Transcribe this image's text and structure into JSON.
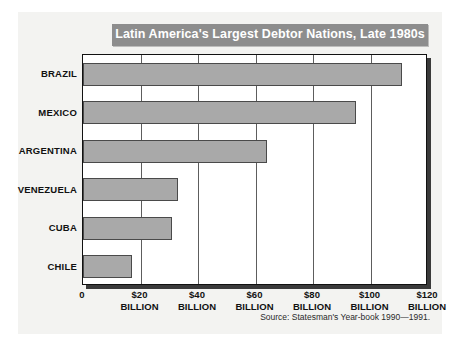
{
  "card": {
    "title": "Latin America's Largest Debtor Nations, Late 1980s",
    "source": "Source: Statesman's Year-book 1990—1991."
  },
  "axis": {
    "origin_label": "0",
    "unit_label": "BILLION",
    "ticks": [
      "0",
      "$20",
      "$40",
      "$60",
      "$80",
      "$100",
      "$120"
    ]
  },
  "colors": {
    "bar_fill": "#a9a9a9",
    "bar_border": "#4a4a4a",
    "banner": "#8d8d8d",
    "banner_text": "#ffffff",
    "card_background": "#f3f3f1",
    "plot_background": "#ffffff",
    "gridline": "#5d5d5d"
  },
  "chart_data": {
    "type": "bar",
    "orientation": "horizontal",
    "title": "Latin America's Largest Debtor Nations, Late 1980s",
    "xlabel": "",
    "ylabel": "",
    "categories": [
      "BRAZIL",
      "MEXICO",
      "ARGENTINA",
      "VENEZUELA",
      "CUBA",
      "CHILE"
    ],
    "values": [
      111,
      95,
      64,
      33,
      31,
      17
    ],
    "value_unit": "billion US dollars",
    "xlim": [
      0,
      120
    ],
    "xticks": [
      0,
      20,
      40,
      60,
      80,
      100,
      120
    ],
    "xtick_labels": [
      "0",
      "$20 BILLION",
      "$40 BILLION",
      "$60 BILLION",
      "$80 BILLION",
      "$100 BILLION",
      "$120 BILLION"
    ],
    "grid": "vertical",
    "legend": "none",
    "source": "Source: Statesman's Year-book 1990—1991."
  }
}
